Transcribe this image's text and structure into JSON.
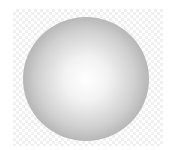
{
  "image": {
    "subject": "shaded sphere",
    "background": "transparency checkerboard",
    "colors": {
      "sphere_center": "#ffffff",
      "sphere_edge": "#8a8a8a",
      "checker_light": "#ffffff",
      "checker_dark": "#f0f0f0"
    }
  }
}
